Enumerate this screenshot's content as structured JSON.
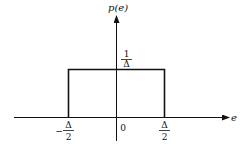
{
  "diagram": {
    "type": "uniform-probability-density",
    "y_axis_label": "p(e)",
    "x_axis_label": "e",
    "height_label": {
      "numerator": "1",
      "denominator": "Δ"
    },
    "origin_label": "0",
    "left_bound": {
      "sign": "−",
      "numerator": "Δ",
      "denominator": "2"
    },
    "right_bound": {
      "numerator": "Δ",
      "denominator": "2"
    }
  }
}
